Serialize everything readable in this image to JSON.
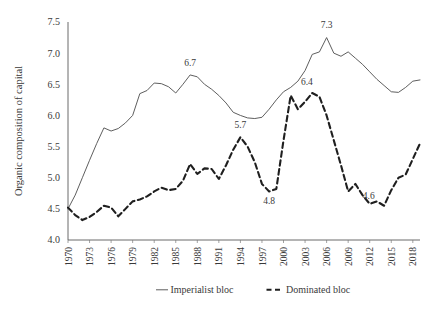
{
  "chart_data": {
    "type": "line",
    "title": "",
    "xlabel": "",
    "ylabel": "Organic composition of capital",
    "ylim": [
      4.0,
      7.5
    ],
    "xlim": [
      1970,
      2019
    ],
    "grid": false,
    "legend_position": "bottom",
    "y_ticks": [
      "4.0",
      "4.5",
      "5.0",
      "5.5",
      "6.0",
      "6.5",
      "7.0",
      "7.5"
    ],
    "y_tick_values": [
      4.0,
      4.5,
      5.0,
      5.5,
      6.0,
      6.5,
      7.0,
      7.5
    ],
    "x_tick_labels": [
      "1970",
      "1973",
      "1976",
      "1979",
      "1982",
      "1985",
      "1988",
      "1991",
      "1994",
      "1997",
      "2000",
      "2003",
      "2006",
      "2009",
      "2012",
      "2015",
      "2018"
    ],
    "x_tick_values": [
      1970,
      1973,
      1976,
      1979,
      1982,
      1985,
      1988,
      1991,
      1994,
      1997,
      2000,
      2003,
      2006,
      2009,
      2012,
      2015,
      2018
    ],
    "x": [
      1970,
      1971,
      1972,
      1973,
      1974,
      1975,
      1976,
      1977,
      1978,
      1979,
      1980,
      1981,
      1982,
      1983,
      1984,
      1985,
      1986,
      1987,
      1988,
      1989,
      1990,
      1991,
      1992,
      1993,
      1994,
      1995,
      1996,
      1997,
      1998,
      1999,
      2000,
      2001,
      2002,
      2003,
      2004,
      2005,
      2006,
      2007,
      2008,
      2009,
      2010,
      2011,
      2012,
      2013,
      2014,
      2015,
      2016,
      2017,
      2018,
      2019
    ],
    "series": [
      {
        "name": "Imperialist bloc",
        "style": "solid",
        "color": "#555555",
        "values": [
          4.5,
          4.72,
          5.0,
          5.28,
          5.55,
          5.8,
          5.75,
          5.79,
          5.88,
          6.0,
          6.35,
          6.4,
          6.52,
          6.51,
          6.46,
          6.36,
          6.5,
          6.65,
          6.62,
          6.5,
          6.42,
          6.32,
          6.2,
          6.05,
          6.0,
          5.96,
          5.95,
          5.97,
          6.1,
          6.25,
          6.38,
          6.45,
          6.55,
          6.72,
          6.98,
          7.02,
          7.25,
          7.0,
          6.95,
          7.02,
          6.92,
          6.82,
          6.7,
          6.58,
          6.48,
          6.38,
          6.37,
          6.45,
          6.55,
          6.57
        ]
      },
      {
        "name": "Dominated bloc",
        "style": "dashed",
        "color": "#1f1f1f",
        "values": [
          4.52,
          4.4,
          4.32,
          4.37,
          4.45,
          4.55,
          4.52,
          4.38,
          4.5,
          4.62,
          4.65,
          4.7,
          4.78,
          4.84,
          4.8,
          4.82,
          4.95,
          5.22,
          5.06,
          5.15,
          5.14,
          4.98,
          5.2,
          5.45,
          5.65,
          5.5,
          5.25,
          4.9,
          4.78,
          4.82,
          5.6,
          6.32,
          6.1,
          6.22,
          6.36,
          6.3,
          6.0,
          5.6,
          5.2,
          4.78,
          4.9,
          4.72,
          4.58,
          4.62,
          4.55,
          4.8,
          5.0,
          5.05,
          5.3,
          5.55
        ]
      }
    ],
    "annotations": [
      {
        "label": "6.7",
        "x": 1987,
        "y": 6.65
      },
      {
        "label": "5.7",
        "x": 1994,
        "y": 5.65
      },
      {
        "label": "4.8",
        "x": 1998,
        "y": 4.78
      },
      {
        "label": "6.4",
        "x": 2002,
        "y": 6.36
      },
      {
        "label": "7.3",
        "x": 2006,
        "y": 7.25
      },
      {
        "label": "4.6",
        "x": 2012,
        "y": 4.58
      }
    ]
  },
  "legend": {
    "items": [
      {
        "label": "Imperialist bloc",
        "style": "solid"
      },
      {
        "label": "Dominated bloc",
        "style": "dashed"
      }
    ]
  }
}
